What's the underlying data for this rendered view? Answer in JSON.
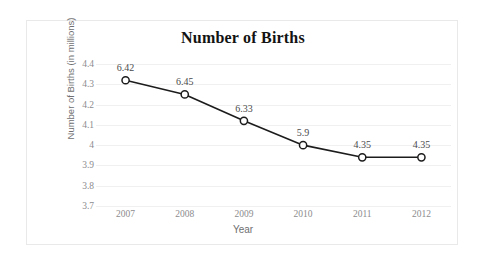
{
  "chart_data": {
    "type": "line",
    "title": "Number of Births",
    "xlabel": "Year",
    "ylabel": "Number of Births (in millions)",
    "categories": [
      "2007",
      "2008",
      "2009",
      "2010",
      "2011",
      "2012"
    ],
    "values": [
      4.32,
      4.25,
      4.12,
      4.0,
      3.94,
      3.94
    ],
    "point_labels": [
      "6.42",
      "6.45",
      "6.33",
      "5.9",
      "4.35",
      "4.35"
    ],
    "ytick_labels": [
      "4.4",
      "4.3",
      "4.2",
      "4.1",
      "4",
      "3.9",
      "3.8",
      "3.7"
    ],
    "yticks": [
      4.4,
      4.3,
      4.2,
      4.1,
      4.0,
      3.9,
      3.8,
      3.7
    ],
    "ylim": [
      3.7,
      4.4
    ],
    "grid": true,
    "legend": "none",
    "series": [
      {
        "name": "Number of Births",
        "values": [
          4.32,
          4.25,
          4.12,
          4.0,
          3.94,
          3.94
        ],
        "labels": [
          "6.42",
          "6.45",
          "6.33",
          "5.9",
          "4.35",
          "4.35"
        ]
      }
    ],
    "colors": {
      "line": "#1c1c1c",
      "marker_fill": "#ffffff",
      "marker_stroke": "#1c1c1c",
      "grid": "#f0f0f1",
      "tick_text": "#8c8c8e",
      "axis_title_text": "#6f6f71",
      "title_text": "#131313",
      "card_border": "#e9e9ea",
      "background": "#ffffff"
    }
  }
}
